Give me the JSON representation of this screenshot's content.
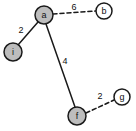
{
  "figure": {
    "background_color": "#ffffff",
    "width": 136,
    "height": 131
  },
  "style": {
    "node_fill_filled": "#bdbdbd",
    "node_fill_hollow": "#ffffff",
    "node_stroke": "#1a1a1a",
    "edge_stroke": "#1a1a1a"
  },
  "graph": {
    "nodes": [
      {
        "id": "a",
        "label": "a",
        "x": 44,
        "y": 15,
        "r": 9,
        "fill": "filled"
      },
      {
        "id": "b",
        "label": "b",
        "x": 104,
        "y": 11,
        "r": 8,
        "fill": "hollow"
      },
      {
        "id": "i",
        "label": "i",
        "x": 13,
        "y": 52,
        "r": 9,
        "fill": "filled"
      },
      {
        "id": "f",
        "label": "f",
        "x": 77,
        "y": 116,
        "r": 9,
        "fill": "filled"
      },
      {
        "id": "g",
        "label": "g",
        "x": 122,
        "y": 97,
        "r": 8,
        "fill": "hollow"
      }
    ],
    "edges": [
      {
        "from": "a",
        "to": "b",
        "weight": "6",
        "style": "dashed",
        "label_x": 74,
        "label_y": 7
      },
      {
        "from": "a",
        "to": "i",
        "weight": "2",
        "style": "solid",
        "label_x": 21,
        "label_y": 30
      },
      {
        "from": "a",
        "to": "f",
        "weight": "4",
        "style": "solid",
        "label_x": 65,
        "label_y": 61
      },
      {
        "from": "f",
        "to": "g",
        "weight": "2",
        "style": "dashed",
        "label_x": 100,
        "label_y": 96
      }
    ]
  }
}
